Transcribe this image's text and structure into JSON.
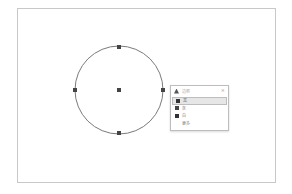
{
  "canvas": {
    "frame_color": "#c8c8c8",
    "circle": {
      "cx": 119,
      "cy": 90,
      "r": 44,
      "stroke": "#7a7a7a",
      "handle_color": "#444444",
      "handles": [
        {
          "name": "top",
          "x": 119,
          "y": 47
        },
        {
          "name": "right",
          "x": 163,
          "y": 90
        },
        {
          "name": "bottom",
          "x": 119,
          "y": 133
        },
        {
          "name": "left",
          "x": 75,
          "y": 90
        },
        {
          "name": "center",
          "x": 119,
          "y": 90
        }
      ]
    }
  },
  "panel": {
    "header": {
      "icon": "fill-icon",
      "label": "边框",
      "close": "×"
    },
    "items": [
      {
        "label": "黑",
        "swatch": "#333333",
        "selected": true
      },
      {
        "label": "灰",
        "swatch": "#444444",
        "selected": false
      },
      {
        "label": "白",
        "swatch": "#333333",
        "selected": false
      },
      {
        "label": "更多",
        "swatch": null,
        "selected": false
      }
    ]
  }
}
